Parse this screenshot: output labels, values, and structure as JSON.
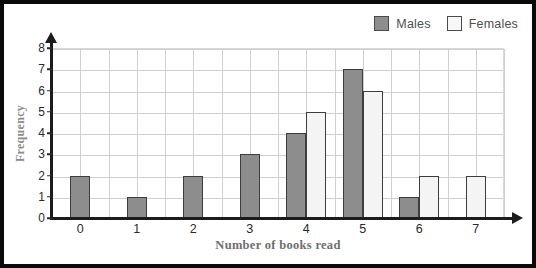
{
  "chart_data": {
    "type": "bar",
    "title": "",
    "xlabel": "Number of books read",
    "ylabel": "Frequency",
    "categories": [
      "0",
      "1",
      "2",
      "3",
      "4",
      "5",
      "6",
      "7"
    ],
    "series": [
      {
        "name": "Males",
        "color": "#8d8d8d",
        "values": [
          2,
          1,
          2,
          3,
          4,
          7,
          1,
          0
        ]
      },
      {
        "name": "Females",
        "color": "#f4f4f4",
        "values": [
          0,
          0,
          0,
          0,
          5,
          6,
          2,
          2
        ]
      }
    ],
    "ylim": [
      0,
      8
    ],
    "yticks": [
      "0",
      "1",
      "2",
      "3",
      "4",
      "5",
      "6",
      "7",
      "8"
    ],
    "grid": true,
    "legend_position": "top-right"
  },
  "legend": {
    "entries": [
      {
        "label": "Males",
        "swatch": "males-swatch"
      },
      {
        "label": "Females",
        "swatch": "females-swatch"
      }
    ]
  },
  "colors": {
    "males_fill": "#8d8d8d",
    "females_fill": "#f4f4f4",
    "bar_border": "#3d3d3d",
    "axis": "#1c1c1c",
    "grid": "#cfcfcf",
    "axis_title": "#6e6e6e",
    "frame": "#0a0a0a"
  }
}
